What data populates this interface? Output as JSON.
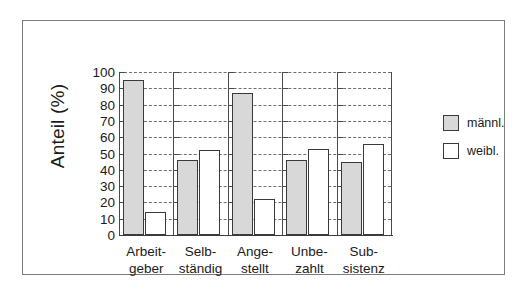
{
  "chart_data": {
    "type": "bar",
    "title": "",
    "subtitle": "",
    "xlabel": "",
    "ylabel": "Anteil (%)",
    "ylim": [
      0,
      100
    ],
    "ytick_step": 10,
    "yticks": [
      "100",
      "90",
      "80",
      "70",
      "60",
      "50",
      "40",
      "30",
      "20",
      "10",
      "0"
    ],
    "grid": "horizontal-dashed",
    "legend_position": "right",
    "categories": [
      "Arbeit-\ngeber",
      "Selb-\nständig",
      "Ange-\nstellt",
      "Unbe-\nzahlt",
      "Sub-\nsistenz"
    ],
    "category_lines": [
      [
        "Arbeit-",
        "geber"
      ],
      [
        "Selb-",
        "ständig"
      ],
      [
        "Ange-",
        "stellt"
      ],
      [
        "Unbe-",
        "zahlt"
      ],
      [
        "Sub-",
        "sistenz"
      ]
    ],
    "series": [
      {
        "name": "männl.",
        "color": "#d8d8d8",
        "values": [
          95,
          46,
          87,
          46,
          45
        ]
      },
      {
        "name": "weibl.",
        "color": "#ffffff",
        "values": [
          14,
          52,
          22,
          53,
          56
        ]
      }
    ]
  },
  "legend": {
    "items": [
      {
        "label": "männl.",
        "swatch": "male"
      },
      {
        "label": "weibl.",
        "swatch": "female"
      }
    ]
  },
  "axis": {
    "y_title": "Anteil (%)"
  }
}
